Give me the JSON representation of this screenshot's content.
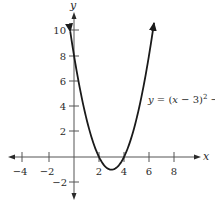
{
  "chart_data": {
    "type": "line",
    "title": "",
    "equation_label": "y = (x − 3)² − 1",
    "xlabel": "x",
    "ylabel": "y",
    "xlim": [
      -5,
      9
    ],
    "ylim": [
      -3,
      11
    ],
    "x_ticks": [
      -4,
      -2,
      2,
      4,
      6,
      8
    ],
    "x_tick_labels": [
      "−4",
      "−2",
      "2",
      "4",
      "6",
      "8"
    ],
    "y_ticks": [
      10,
      8,
      6,
      4,
      2,
      -2
    ],
    "y_tick_labels": [
      "10",
      "8",
      "6",
      "4",
      "2",
      "−2"
    ],
    "grid": false,
    "series": [
      {
        "name": "y = (x - 3)^2 - 1",
        "function": "(x-3)^2-1",
        "x": [
          -0.3,
          0,
          1,
          2,
          3,
          4,
          5,
          6,
          6.4
        ],
        "y": [
          9.89,
          8,
          3,
          0,
          -1,
          0,
          3,
          8,
          10.56
        ],
        "vertex": [
          3,
          -1
        ],
        "x_intercepts": [
          2,
          4
        ],
        "y_intercept": 8,
        "arrows_at_ends": true
      }
    ]
  }
}
